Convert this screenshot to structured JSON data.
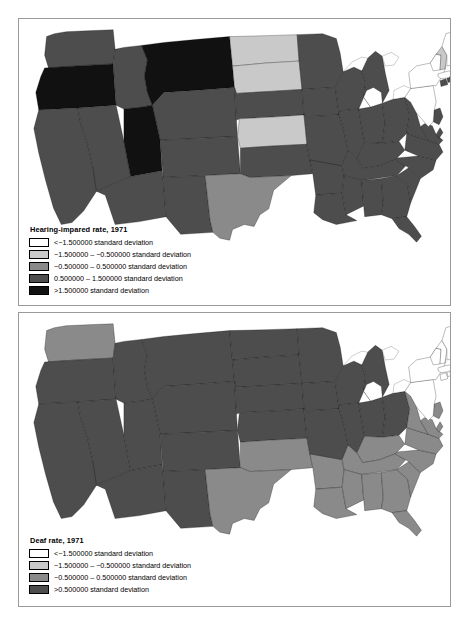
{
  "figure": {
    "background_color": "#ffffff",
    "frame_color": "#9a9a9a"
  },
  "palette": {
    "cat_lt_neg15": "#ffffff",
    "cat_neg15_neg05": "#c9c9c9",
    "cat_neg05_pos05": "#8a8a8a",
    "cat_pos05_pos15": "#4d4d4d",
    "cat_gt_pos15": "#111111",
    "cat_gt_pos05": "#4d4d4d",
    "border": "#000000"
  },
  "panels": [
    {
      "id": "hearing-impaired",
      "legend": {
        "title": "Hearing-impared rate, 1971",
        "entries": [
          {
            "label": "<−1.500000 standard deviation",
            "color": "#ffffff"
          },
          {
            "label": "−1.500000 – −0.500000 standard deviation",
            "color": "#c9c9c9"
          },
          {
            "label": "−0.500000 – 0.500000 standard deviation",
            "color": "#8a8a8a"
          },
          {
            "label": "0.500000 – 1.500000 standard deviation",
            "color": "#4d4d4d"
          },
          {
            "label": ">1.500000 standard deviation",
            "color": "#111111"
          }
        ]
      },
      "map_data": {
        "type": "choropleth",
        "title": "Hearing-impared rate, 1971",
        "unit": "standard deviation",
        "states": {
          "WA": "cat_pos05_pos15",
          "OR": "cat_gt_pos15",
          "CA": "cat_pos05_pos15",
          "NV": "cat_pos05_pos15",
          "ID": "cat_pos05_pos15",
          "MT": "cat_gt_pos15",
          "WY": "cat_pos05_pos15",
          "UT": "cat_gt_pos15",
          "AZ": "cat_pos05_pos15",
          "CO": "cat_pos05_pos15",
          "NM": "cat_pos05_pos15",
          "ND": "cat_neg15_neg05",
          "SD": "cat_neg15_neg05",
          "NE": "cat_pos05_pos15",
          "KS": "cat_neg15_neg05",
          "OK": "cat_pos05_pos15",
          "TX": "cat_neg05_pos05",
          "MN": "cat_pos05_pos15",
          "IA": "cat_pos05_pos15",
          "MO": "cat_pos05_pos15",
          "AR": "cat_pos05_pos15",
          "LA": "cat_pos05_pos15",
          "WI": "cat_pos05_pos15",
          "IL": "cat_pos05_pos15",
          "MI": "cat_pos05_pos15",
          "IN": "cat_pos05_pos15",
          "OH": "cat_pos05_pos15",
          "KY": "cat_pos05_pos15",
          "TN": "cat_pos05_pos15",
          "MS": "cat_pos05_pos15",
          "AL": "cat_pos05_pos15",
          "GA": "cat_pos05_pos15",
          "FL": "cat_pos05_pos15",
          "SC": "cat_pos05_pos15",
          "NC": "cat_pos05_pos15",
          "VA": "cat_pos05_pos15",
          "WV": "cat_pos05_pos15",
          "MD": "cat_pos05_pos15",
          "DE": "cat_pos05_pos15",
          "NJ": "cat_pos05_pos15",
          "PA": "cat_lt_neg15",
          "NY": "cat_lt_neg15",
          "CT": "cat_pos05_pos15",
          "RI": "cat_pos05_pos15",
          "MA": "cat_lt_neg15",
          "VT": "cat_lt_neg15",
          "NH": "cat_neg15_neg05",
          "ME": "cat_lt_neg15"
        }
      }
    },
    {
      "id": "deaf",
      "legend": {
        "title": "Deaf rate, 1971",
        "entries": [
          {
            "label": "<−1.500000 standard deviation",
            "color": "#ffffff"
          },
          {
            "label": "−1.500000 – −0.500000 standard deviation",
            "color": "#c9c9c9"
          },
          {
            "label": "−0.500000 – 0.500000 standard deviation",
            "color": "#8a8a8a"
          },
          {
            "label": ">0.500000 standard deviation",
            "color": "#4d4d4d"
          }
        ]
      },
      "map_data": {
        "type": "choropleth",
        "title": "Deaf rate, 1971",
        "unit": "standard deviation",
        "states": {
          "WA": "cat_neg05_pos05",
          "OR": "cat_gt_pos05",
          "CA": "cat_gt_pos05",
          "NV": "cat_gt_pos05",
          "ID": "cat_gt_pos05",
          "MT": "cat_gt_pos05",
          "WY": "cat_gt_pos05",
          "UT": "cat_gt_pos05",
          "AZ": "cat_gt_pos05",
          "CO": "cat_gt_pos05",
          "NM": "cat_gt_pos05",
          "ND": "cat_gt_pos05",
          "SD": "cat_gt_pos05",
          "NE": "cat_gt_pos05",
          "KS": "cat_gt_pos05",
          "OK": "cat_neg05_pos05",
          "TX": "cat_neg05_pos05",
          "MN": "cat_gt_pos05",
          "IA": "cat_gt_pos05",
          "MO": "cat_gt_pos05",
          "AR": "cat_neg05_pos05",
          "LA": "cat_neg05_pos05",
          "WI": "cat_gt_pos05",
          "IL": "cat_gt_pos05",
          "MI": "cat_gt_pos05",
          "IN": "cat_gt_pos05",
          "OH": "cat_gt_pos05",
          "KY": "cat_neg05_pos05",
          "TN": "cat_neg05_pos05",
          "MS": "cat_neg05_pos05",
          "AL": "cat_neg05_pos05",
          "GA": "cat_neg05_pos05",
          "FL": "cat_neg05_pos05",
          "SC": "cat_neg05_pos05",
          "NC": "cat_neg05_pos05",
          "VA": "cat_neg05_pos05",
          "WV": "cat_neg05_pos05",
          "MD": "cat_neg05_pos05",
          "DE": "cat_neg05_pos05",
          "NJ": "cat_neg05_pos05",
          "PA": "cat_lt_neg15",
          "NY": "cat_lt_neg15",
          "CT": "cat_lt_neg15",
          "RI": "cat_lt_neg15",
          "MA": "cat_lt_neg15",
          "VT": "cat_lt_neg15",
          "NH": "cat_lt_neg15",
          "ME": "cat_lt_neg15"
        }
      }
    }
  ]
}
